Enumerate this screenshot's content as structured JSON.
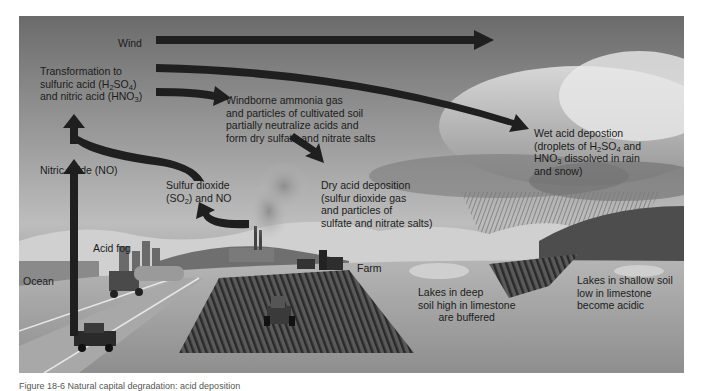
{
  "figure": {
    "colors": {
      "arrow": "#1f1f1f",
      "sky_top": "#6b6b6b",
      "sky_mid": "#bdbdbd",
      "ground": "#9c9c9c",
      "text": "#1c1c1c"
    },
    "labels": {
      "wind": "Wind",
      "transformation": {
        "line1": "Transformation to",
        "line2_pre": "sulfuric acid (H",
        "line2_sub1": "2",
        "line2_mid": "SO",
        "line2_sub2": "4",
        "line2_post": ")",
        "line3_pre": "and nitric acid (HNO",
        "line3_sub": "3",
        "line3_post": ")"
      },
      "windborne": {
        "line1": "Windborne ammonia gas",
        "line2": "and particles of cultivated soil",
        "line3": "partially neutralize acids and",
        "line4": "form dry sulfate and nitrate salts"
      },
      "wet_deposition": {
        "line1": "Wet acid depostion",
        "line2_pre": "(droplets of H",
        "line2_sub1": "2",
        "line2_mid": "SO",
        "line2_sub2": "4",
        "line2_post": " and",
        "line3_pre": "HNO",
        "line3_sub": "3",
        "line3_post": " dissolved in rain",
        "line4": "and snow)"
      },
      "nitric_oxide": "Nitric oxide (NO)",
      "sulfur_dioxide": {
        "line1": "Sulfur dioxide",
        "line2_pre": "(SO",
        "line2_sub": "2",
        "line2_post": ") and NO"
      },
      "dry_deposition": {
        "line1": "Dry acid deposition",
        "line2": "(sulfur dioxide gas",
        "line3": "and particles of",
        "line4": "sulfate and nitrate salts)"
      },
      "acid_fog": "Acid fog",
      "ocean": "Ocean",
      "farm": "Farm",
      "lakes_deep": {
        "line1": "Lakes in deep",
        "line2": "soil high in limestone",
        "line3": "are buffered"
      },
      "lakes_shallow": {
        "line1": "Lakes in shallow soil",
        "line2": "low in limestone",
        "line3": "become acidic"
      }
    },
    "caption": "Figure 18-6  Natural capital degradation: acid deposition"
  }
}
